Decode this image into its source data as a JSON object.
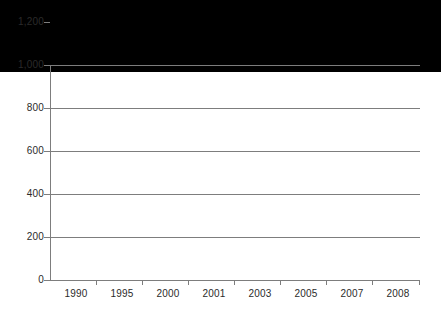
{
  "chart_data": {
    "type": "bar",
    "title": "",
    "subtitle": "",
    "xlabel": "",
    "ylabel": "",
    "categories": [
      "1990",
      "1995",
      "2000",
      "2001",
      "2003",
      "2005",
      "2007",
      "2008"
    ],
    "values": [
      335,
      200,
      505,
      630,
      740,
      890,
      1105,
      1095
    ],
    "ylim": [
      0,
      1200
    ],
    "ytick_values": [
      0,
      200,
      400,
      600,
      800,
      1000,
      1200
    ],
    "ytick_labels": [
      "0",
      "200",
      "400",
      "600",
      "800",
      "1,000",
      "1,200"
    ],
    "grid": "horizontal",
    "legend": "none",
    "bar_color": "#000000",
    "gridline_color": "#7d7d7d",
    "axis_color": "#7d7d7d",
    "background_color": "#ffffff",
    "text_color": "#2b2b2b"
  }
}
